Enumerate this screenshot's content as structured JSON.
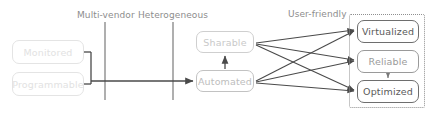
{
  "diagram": {
    "type": "flow-diagram",
    "canvas": {
      "width": 434,
      "height": 115,
      "background": "#ffffff"
    },
    "stage_labels": [
      {
        "id": "multi-vendor",
        "text": "Multi-vendor",
        "x": 77,
        "y": 10
      },
      {
        "id": "heterogeneous",
        "text": "Heterogeneous",
        "x": 138,
        "y": 10
      },
      {
        "id": "user-friendly",
        "text": "User-friendly",
        "x": 288,
        "y": 9
      }
    ],
    "nodes": [
      {
        "id": "monitored",
        "label": "Monitored",
        "x": 12,
        "y": 40,
        "w": 72,
        "h": 24,
        "style": "faint"
      },
      {
        "id": "programmable",
        "label": "Programmable",
        "x": 12,
        "y": 72,
        "w": 72,
        "h": 24,
        "style": "faint"
      },
      {
        "id": "sharable",
        "label": "Sharable",
        "x": 196,
        "y": 31,
        "w": 58,
        "h": 22,
        "style": "mid"
      },
      {
        "id": "automated",
        "label": "Automated",
        "x": 196,
        "y": 70,
        "w": 58,
        "h": 22,
        "style": "mid2"
      },
      {
        "id": "virtualized",
        "label": "Virtualized",
        "x": 357,
        "y": 20,
        "w": 62,
        "h": 23,
        "style": "strong"
      },
      {
        "id": "reliable",
        "label": "Reliable",
        "x": 357,
        "y": 50,
        "w": 62,
        "h": 23,
        "style": "semi"
      },
      {
        "id": "optimized",
        "label": "Optimized",
        "x": 357,
        "y": 80,
        "w": 62,
        "h": 23,
        "style": "strong"
      }
    ],
    "groups": [
      {
        "id": "user-friendly-group",
        "x": 349,
        "y": 14,
        "w": 76,
        "h": 94,
        "border": "dotted",
        "color": "#8f8f8f"
      }
    ],
    "dividers": [
      {
        "id": "divider-multi-vendor",
        "x": 105,
        "y1": 22,
        "y2": 100,
        "color": "#8d8d8d"
      },
      {
        "id": "divider-heterogeneous",
        "x": 173,
        "y1": 22,
        "y2": 100,
        "color": "#8d8d8d"
      }
    ],
    "edges": [
      {
        "id": "edge-monitored-join",
        "from": "monitored",
        "to": "join-bracket",
        "kind": "bracket"
      },
      {
        "id": "edge-programmable-join",
        "from": "programmable",
        "to": "join-bracket",
        "kind": "bracket"
      },
      {
        "id": "edge-join-automated",
        "from": "join-bracket",
        "to": "automated",
        "kind": "arrow"
      },
      {
        "id": "edge-automated-sharable",
        "from": "automated",
        "to": "sharable",
        "kind": "arrow"
      },
      {
        "id": "edge-sharable-virtualized",
        "from": "sharable",
        "to": "virtualized",
        "kind": "arrow"
      },
      {
        "id": "edge-sharable-reliable",
        "from": "sharable",
        "to": "reliable",
        "kind": "arrow"
      },
      {
        "id": "edge-sharable-optimized",
        "from": "sharable",
        "to": "optimized",
        "kind": "arrow"
      },
      {
        "id": "edge-automated-virtualized",
        "from": "automated",
        "to": "virtualized",
        "kind": "arrow"
      },
      {
        "id": "edge-automated-reliable",
        "from": "automated",
        "to": "reliable",
        "kind": "arrow"
      },
      {
        "id": "edge-automated-optimized",
        "from": "automated",
        "to": "optimized",
        "kind": "arrow"
      },
      {
        "id": "edge-reliable-optimized",
        "from": "reliable",
        "to": "optimized",
        "kind": "arrow"
      }
    ],
    "colors": {
      "line": "#555555",
      "line_light": "#8d8d8d",
      "text_faint": "#e2e2e2",
      "text_mid": "#c9c9c9",
      "text_strong": "#5a5a5a",
      "background": "#ffffff"
    }
  }
}
